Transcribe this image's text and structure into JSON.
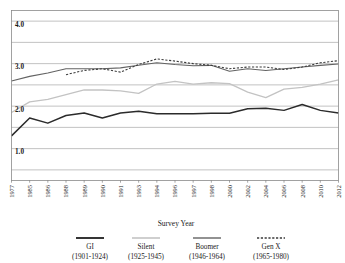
{
  "chart_data": {
    "type": "line",
    "title": "",
    "xlabel": "Survey Year",
    "ylabel": "",
    "ylim": [
      0.25,
      4.25
    ],
    "yticks": [
      1.0,
      2.0,
      3.0,
      4.0
    ],
    "ytick_labels": [
      "1.0",
      "2.0",
      "3.0",
      "4.0"
    ],
    "gridlines": [
      0.5,
      1.0,
      1.5,
      2.0,
      2.5,
      3.0,
      3.5,
      4.0
    ],
    "grid": true,
    "legend_position": "below",
    "x": [
      1977,
      1985,
      1986,
      1988,
      1989,
      1990,
      1991,
      1993,
      1994,
      1996,
      1997,
      1998,
      2000,
      2002,
      2004,
      2006,
      2008,
      2010,
      2012
    ],
    "xtick_labels": [
      "1977",
      "1985",
      "1986",
      "1988",
      "1989",
      "1990",
      "1991",
      "1993",
      "1994",
      "1996",
      "1997",
      "1998",
      "2000",
      "2002",
      "2004",
      "2006",
      "2008",
      "2010",
      "2012"
    ],
    "series": [
      {
        "name": "GI",
        "years": "(1901-1924)",
        "color": "#2b2b2b",
        "width": 1.5,
        "dash": "none",
        "values": [
          1.3,
          1.72,
          1.6,
          1.78,
          1.84,
          1.72,
          1.84,
          1.88,
          1.82,
          1.82,
          1.82,
          1.83,
          1.83,
          1.94,
          1.95,
          1.9,
          2.04,
          1.9,
          1.84
        ]
      },
      {
        "name": "Silent",
        "years": "(1925-1945)",
        "color": "#c3c3c3",
        "width": 1.3,
        "dash": "none",
        "values": [
          1.85,
          2.1,
          2.16,
          2.27,
          2.38,
          2.38,
          2.36,
          2.3,
          2.52,
          2.58,
          2.52,
          2.55,
          2.53,
          2.33,
          2.2,
          2.4,
          2.44,
          2.52,
          2.62
        ]
      },
      {
        "name": "Boomer",
        "years": "(1946-1964)",
        "color": "#636363",
        "width": 1.1,
        "dash": "none",
        "values": [
          2.59,
          2.7,
          2.78,
          2.88,
          2.88,
          2.88,
          2.9,
          2.96,
          3.02,
          2.98,
          2.95,
          2.96,
          2.82,
          2.88,
          2.84,
          2.88,
          2.92,
          2.96,
          2.99
        ]
      },
      {
        "name": "Gen X",
        "years": "(1965-1980)",
        "color": "#3a3a3a",
        "width": 1.1,
        "dash": "2.2,1.6",
        "values": [
          null,
          null,
          null,
          2.74,
          2.84,
          2.88,
          2.8,
          2.98,
          3.11,
          3.06,
          3.0,
          2.96,
          2.88,
          2.92,
          2.92,
          2.86,
          2.92,
          3.02,
          3.07
        ]
      }
    ]
  },
  "legend": {
    "items": [
      {
        "label": "GI",
        "years": "(1901-1924)"
      },
      {
        "label": "Silent",
        "years": "(1925-1945)"
      },
      {
        "label": "Boomer",
        "years": "(1946-1964)"
      },
      {
        "label": "Gen X",
        "years": "(1965-1980)"
      }
    ]
  }
}
